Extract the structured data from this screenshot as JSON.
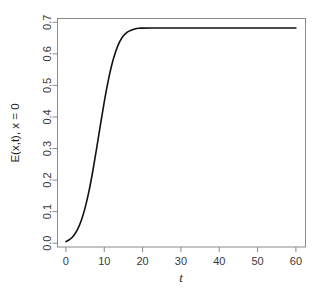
{
  "chart_data": {
    "type": "line",
    "title": "",
    "xlabel": "t",
    "ylabel": "E(x,t), x = 0",
    "xlim": [
      -2.2,
      62.5
    ],
    "ylim": [
      -0.012,
      0.712
    ],
    "xticks": [
      0,
      10,
      20,
      30,
      40,
      50,
      60
    ],
    "xtick_labels": [
      "0",
      "10",
      "20",
      "30",
      "40",
      "50",
      "60"
    ],
    "yticks": [
      0.0,
      0.1,
      0.2,
      0.3,
      0.4,
      0.5,
      0.6,
      0.7
    ],
    "ytick_labels": [
      "0.0",
      "0.1",
      "0.2",
      "0.3",
      "0.4",
      "0.5",
      "0.6",
      "0.7"
    ],
    "grid": false,
    "legend": false,
    "box": "full",
    "line_color": "#111111",
    "axis_color": "#8a8a8a",
    "background": "#ffffff",
    "plateau_value": 0.682,
    "series": [
      {
        "name": "E(0,t)",
        "x": [
          0,
          1,
          2,
          3,
          4,
          5,
          6,
          7,
          8,
          9,
          10,
          11,
          12,
          13,
          14,
          15,
          16,
          17,
          18,
          19,
          20,
          22,
          24,
          26,
          28,
          30,
          34,
          38,
          42,
          46,
          50,
          54,
          58,
          60
        ],
        "y": [
          0.005,
          0.012,
          0.024,
          0.043,
          0.072,
          0.112,
          0.164,
          0.228,
          0.3,
          0.375,
          0.448,
          0.513,
          0.567,
          0.608,
          0.638,
          0.657,
          0.669,
          0.675,
          0.679,
          0.681,
          0.6815,
          0.682,
          0.682,
          0.682,
          0.682,
          0.682,
          0.682,
          0.682,
          0.682,
          0.682,
          0.682,
          0.682,
          0.682,
          0.682
        ]
      }
    ]
  },
  "axes": {
    "y_axis_title": "E(x,t), x = 0",
    "x_axis_title": "t"
  }
}
